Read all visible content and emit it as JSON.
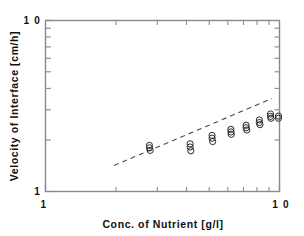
{
  "figure": {
    "kind": "scatter-log-log",
    "background": "#ffffff",
    "frame_color": "#8a8a8a",
    "marker_color": "#2b2b2b",
    "fitline_color": "#4a4a4a"
  },
  "axes": {
    "x_title": "Conc. of  Nutrient  [g/l]",
    "y_title": "Velocity  of  Interface  [cm/h]",
    "x_ticks": [
      "1",
      "1 0"
    ],
    "y_ticks": [
      "1 0",
      "1"
    ]
  },
  "chart_data": {
    "type": "scatter",
    "title": "",
    "subtitle": "",
    "xlabel": "Conc. of Nutrient [g/l]",
    "ylabel": "Velocity of Interface [cm/h]",
    "xscale": "log",
    "yscale": "log",
    "xlim": [
      1,
      10
    ],
    "ylim": [
      1,
      10
    ],
    "x_tick_labels": [
      "1",
      "10"
    ],
    "y_tick_labels": [
      "1",
      "10"
    ],
    "grid": false,
    "legend": null,
    "marker": "open-circle",
    "annotations": [
      {
        "text": "dashed power-law trend line",
        "type": "trendline"
      }
    ],
    "trendline": {
      "style": "dashed",
      "x_start": 2.15,
      "y_start": 1.65,
      "x_end": 9.3,
      "y_end": 2.85
    },
    "points": [
      {
        "x": 2.78,
        "y": 1.86
      },
      {
        "x": 2.78,
        "y": 1.8
      },
      {
        "x": 2.8,
        "y": 1.74
      },
      {
        "x": 4.15,
        "y": 1.9
      },
      {
        "x": 4.15,
        "y": 1.82
      },
      {
        "x": 4.18,
        "y": 1.73
      },
      {
        "x": 5.15,
        "y": 2.13
      },
      {
        "x": 5.15,
        "y": 2.05
      },
      {
        "x": 5.18,
        "y": 1.96
      },
      {
        "x": 6.2,
        "y": 2.31
      },
      {
        "x": 6.2,
        "y": 2.23
      },
      {
        "x": 6.22,
        "y": 2.16
      },
      {
        "x": 7.2,
        "y": 2.44
      },
      {
        "x": 7.2,
        "y": 2.36
      },
      {
        "x": 7.25,
        "y": 2.29
      },
      {
        "x": 8.2,
        "y": 2.62
      },
      {
        "x": 8.2,
        "y": 2.53
      },
      {
        "x": 8.25,
        "y": 2.46
      },
      {
        "x": 9.15,
        "y": 2.84
      },
      {
        "x": 9.15,
        "y": 2.75
      },
      {
        "x": 9.2,
        "y": 2.68
      },
      {
        "x": 9.9,
        "y": 2.76
      },
      {
        "x": 9.9,
        "y": 2.68
      }
    ],
    "series": [
      {
        "name": "Velocity of interface vs nutrient concentration",
        "x": [
          2.78,
          2.78,
          2.8,
          4.15,
          4.15,
          4.18,
          5.15,
          5.15,
          5.18,
          6.2,
          6.2,
          6.22,
          7.2,
          7.2,
          7.25,
          8.2,
          8.2,
          8.25,
          9.15,
          9.15,
          9.2,
          9.9,
          9.9
        ],
        "values": [
          1.86,
          1.8,
          1.74,
          1.9,
          1.82,
          1.73,
          2.13,
          2.05,
          1.96,
          2.31,
          2.23,
          2.16,
          2.44,
          2.36,
          2.29,
          2.62,
          2.53,
          2.46,
          2.84,
          2.75,
          2.68,
          2.76,
          2.68
        ]
      }
    ]
  }
}
